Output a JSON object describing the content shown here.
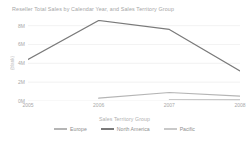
{
  "chart_data": {
    "type": "line",
    "title": "Reseller Total Sales by Calendar Year, and Sales Territory Group",
    "xlabel": "",
    "ylabel": "(blank)",
    "x": [
      "2005",
      "2006",
      "2007",
      "2008"
    ],
    "categories": [
      "2005",
      "2006",
      "2007",
      "2008"
    ],
    "ylim": [
      0,
      8600000
    ],
    "yticks": [
      0,
      2000000,
      4000000,
      6000000,
      8000000
    ],
    "ytick_labels": [
      "0M",
      "2M",
      "4M",
      "6M",
      "8M"
    ],
    "grid": true,
    "legend_position": "bottom",
    "legend_title": "Sales Territory Group",
    "series": [
      {
        "name": "Europe",
        "color": "#b5b5b5",
        "x": [
          "2006",
          "2007",
          "2008"
        ],
        "values": [
          310000,
          900000,
          520000
        ]
      },
      {
        "name": "North America",
        "color": "#7a7a7a",
        "x": [
          "2005",
          "2006",
          "2007",
          "2008"
        ],
        "values": [
          4400000,
          8550000,
          7600000,
          3200000
        ]
      },
      {
        "name": "Pacific",
        "color": "#c9c9c9",
        "x": [
          "2007",
          "2008"
        ],
        "values": [
          160000,
          150000
        ]
      }
    ]
  },
  "axis": {
    "y_title": "(blank)",
    "y_ticks": [
      "8M",
      "6M",
      "4M",
      "2M",
      "0M"
    ],
    "x_ticks": [
      "2005",
      "2006",
      "2007",
      "2008"
    ]
  },
  "legend": {
    "title": "Sales Territory Group",
    "items": [
      {
        "label": "Europe",
        "color": "#b5b5b5"
      },
      {
        "label": "North America",
        "color": "#7a7a7a"
      },
      {
        "label": "Pacific",
        "color": "#c9c9c9"
      }
    ]
  },
  "colors": {
    "grid": "#ededed",
    "text": "#a8a8a8",
    "title": "#a6a6a6",
    "background": "#ffffff"
  }
}
